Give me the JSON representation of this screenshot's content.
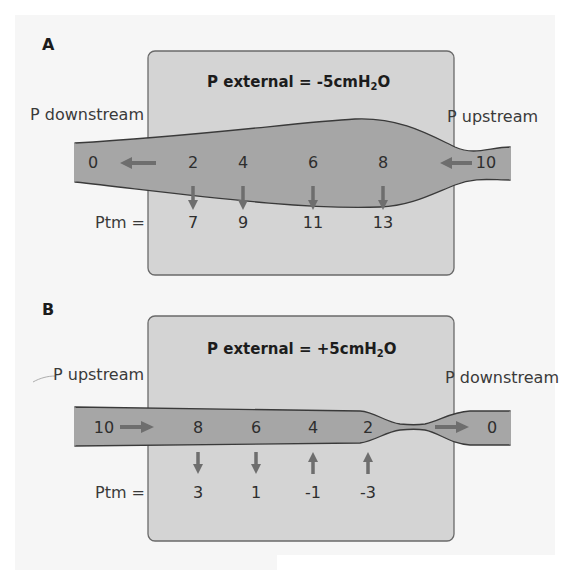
{
  "panels": [
    {
      "id": "A",
      "letter": "A",
      "external_label": "P external = -5cmH",
      "external_sub": "2",
      "external_tail": "O",
      "left_label": "P downstream",
      "right_label": "P upstream",
      "flow_direction": "right-to-left",
      "left_end_value": "0",
      "right_end_value": "10",
      "ptm_label": "Ptm =",
      "points": [
        {
          "pressure": "2",
          "ptm": "7",
          "arrow": "down"
        },
        {
          "pressure": "4",
          "ptm": "9",
          "arrow": "down"
        },
        {
          "pressure": "6",
          "ptm": "11",
          "arrow": "down"
        },
        {
          "pressure": "8",
          "ptm": "13",
          "arrow": "down"
        }
      ]
    },
    {
      "id": "B",
      "letter": "B",
      "external_label": "P external = +5cmH",
      "external_sub": "2",
      "external_tail": "O",
      "left_label": "P upstream",
      "right_label": "P downstream",
      "flow_direction": "left-to-right",
      "left_end_value": "10",
      "right_end_value": "0",
      "ptm_label": "Ptm =",
      "points": [
        {
          "pressure": "8",
          "ptm": "3",
          "arrow": "down"
        },
        {
          "pressure": "6",
          "ptm": "1",
          "arrow": "down"
        },
        {
          "pressure": "4",
          "ptm": "-1",
          "arrow": "up"
        },
        {
          "pressure": "2",
          "ptm": "-3",
          "arrow": "up"
        }
      ]
    }
  ],
  "colors": {
    "page_bg": "#f6f6f6",
    "box_fill": "#d4d4d4",
    "box_stroke": "#6a6a6a",
    "tube_fill": "#a6a6a6",
    "tube_stroke": "#3a3a3a",
    "arrow": "#6e6e6e",
    "text": "#2e2e2e"
  }
}
